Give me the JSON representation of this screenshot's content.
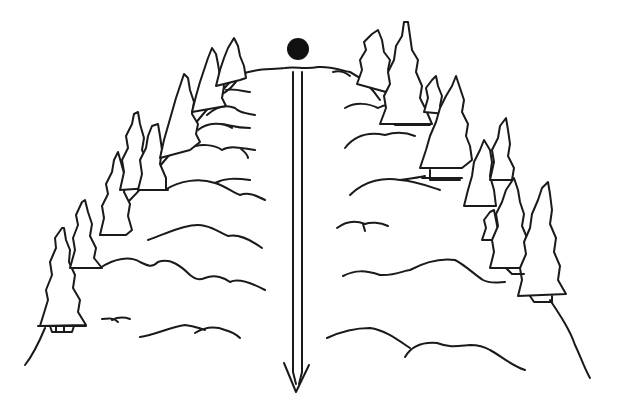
{
  "figure": {
    "description": "Line drawing of a ball at the summit of a forested hill with a long arrow pointing straight down the slope",
    "elements": {
      "ball": {
        "label": "ball",
        "color": "#111111"
      },
      "arrow": {
        "label": "downhill arrow",
        "direction": "down"
      },
      "hill": {
        "label": "hill"
      },
      "trees_left": {
        "label": "pine trees (left slope)",
        "count": 9
      },
      "trees_right": {
        "label": "pine trees (right slope)",
        "count": 10
      }
    },
    "colors": {
      "line": "#1a1a1a",
      "background": "#ffffff"
    }
  }
}
